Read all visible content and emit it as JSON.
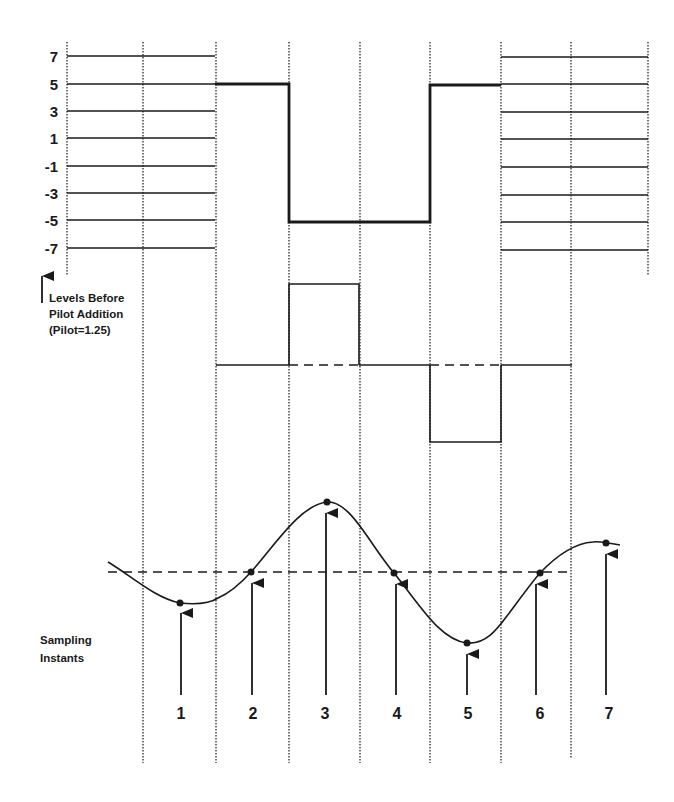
{
  "colors": {
    "ink": "#1a1a1a",
    "background": "#ffffff"
  },
  "levels": {
    "values": [
      "7",
      "5",
      "3",
      "1",
      "-1",
      "-3",
      "-5",
      "-7"
    ]
  },
  "annotation": {
    "line1": "Levels Before",
    "line2": "Pilot Addition",
    "line3": "(Pilot=1.25)"
  },
  "sampling": {
    "label_line1": "Sampling",
    "label_line2": "Instants",
    "instants": [
      "1",
      "2",
      "3",
      "4",
      "5",
      "6",
      "7"
    ]
  },
  "symbol_sequence": [
    {
      "slot": 1,
      "level": null
    },
    {
      "slot": 2,
      "level": 5
    },
    {
      "slot": 3,
      "level": -5
    },
    {
      "slot": 4,
      "level": -5
    },
    {
      "slot": 5,
      "level": 5
    },
    {
      "slot": 6,
      "level": null
    }
  ],
  "pilot_sequence": [
    {
      "slot": 2,
      "value": 0
    },
    {
      "slot": 3,
      "value": 1
    },
    {
      "slot": 4,
      "value": 0
    },
    {
      "slot": 5,
      "value": -1
    },
    {
      "slot": 6,
      "value": 0
    }
  ],
  "waveform_samples": [
    {
      "instant": "1",
      "position": "below"
    },
    {
      "instant": "2",
      "position": "zero-crossing"
    },
    {
      "instant": "3",
      "position": "peak"
    },
    {
      "instant": "4",
      "position": "zero-crossing"
    },
    {
      "instant": "5",
      "position": "trough"
    },
    {
      "instant": "6",
      "position": "zero-crossing"
    },
    {
      "instant": "7",
      "position": "above"
    }
  ]
}
